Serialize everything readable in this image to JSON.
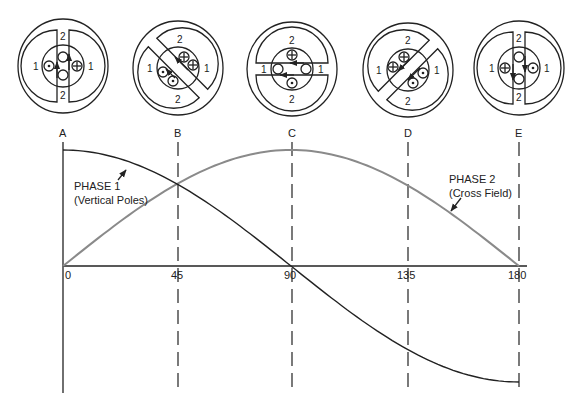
{
  "figure": {
    "rotor_diagrams": [
      {
        "label": "A",
        "angle_deg": 0,
        "pole_labels": {
          "phase1": "1",
          "phase2": "2"
        },
        "arrow": "up"
      },
      {
        "label": "B",
        "angle_deg": 45,
        "pole_labels": {
          "phase1": "1",
          "phase2": "2"
        },
        "arrow": "up-left"
      },
      {
        "label": "C",
        "angle_deg": 90,
        "pole_labels": {
          "phase1": "1",
          "phase2": "2"
        },
        "arrow": "left"
      },
      {
        "label": "D",
        "angle_deg": 135,
        "pole_labels": {
          "phase1": "1",
          "phase2": "2"
        },
        "arrow": "down-left"
      },
      {
        "label": "E",
        "angle_deg": 180,
        "pole_labels": {
          "phase1": "1",
          "phase2": "2"
        },
        "arrow": "down"
      }
    ],
    "annotations": {
      "phase1_title": "PHASE 1",
      "phase1_sub": "(Vertical Poles)",
      "phase2_title": "PHASE 2",
      "phase2_sub": "(Cross Field)"
    },
    "colors": {
      "phase1": "#222222",
      "phase2": "#8a8a8a",
      "axes": "#222222"
    }
  },
  "chart_data": {
    "type": "line",
    "title": "",
    "xlabel": "",
    "ylabel": "",
    "x_ticks": [
      "0",
      "45",
      "90",
      "135",
      "180"
    ],
    "marker_labels": [
      "A",
      "B",
      "C",
      "D",
      "E"
    ],
    "x": [
      0,
      45,
      90,
      135,
      180
    ],
    "xlim": [
      0,
      180
    ],
    "ylim": [
      -1,
      1
    ],
    "grid": "dashed vertical lines at 45, 90, 135, 180",
    "series": [
      {
        "name": "PHASE 1 (Vertical Poles)",
        "function": "cos",
        "values": [
          1.0,
          0.707,
          0.0,
          -0.707,
          -1.0
        ]
      },
      {
        "name": "PHASE 2 (Cross Field)",
        "function": "sin",
        "values": [
          0.0,
          0.707,
          1.0,
          0.707,
          0.0
        ]
      }
    ]
  }
}
